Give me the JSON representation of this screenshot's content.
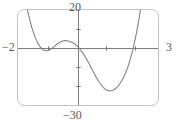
{
  "figure": {
    "kind": "graphing-calculator-screen",
    "frame_color": "#b9b9bb",
    "curve_color": "#7d7d80",
    "axis_color": "#6e6e70",
    "label_color": "#58585a",
    "background": "#ffffff"
  },
  "labels": {
    "y_max": "20",
    "y_min": "−30",
    "x_min": "−2",
    "x_max": "3"
  },
  "chart_data": {
    "type": "line",
    "title": "",
    "xlabel": "",
    "ylabel": "",
    "xlim": [
      -2,
      3
    ],
    "ylim": [
      -30,
      20
    ],
    "grid": false,
    "legend": "none",
    "tick_labels": {
      "x": [
        "−2",
        "3"
      ],
      "y": [
        "−30",
        "20"
      ]
    },
    "x_tick_values": [
      -1,
      1,
      2
    ],
    "y_tick_values": [
      -20,
      -10,
      10
    ],
    "annotations": [
      "viewing window [-2, 3] by [-30, 20]",
      "local minimum near x = -1.1, y ≈ -1",
      "local maximum near x = -0.1, y ≈ 3",
      "local minimum near x = 1.6, y ≈ -20",
      "x-intercepts near x = -1.1 and x = 2.1"
    ],
    "series": [
      {
        "name": "y",
        "x": [
          -2.0,
          -1.9,
          -1.8,
          -1.7,
          -1.6,
          -1.5,
          -1.4,
          -1.3,
          -1.2,
          -1.1,
          -1.0,
          -0.9,
          -0.8,
          -0.7,
          -0.6,
          -0.5,
          -0.4,
          -0.3,
          -0.2,
          -0.1,
          0.0,
          0.1,
          0.2,
          0.3,
          0.4,
          0.5,
          0.6,
          0.7,
          0.8,
          0.9,
          1.0,
          1.1,
          1.2,
          1.3,
          1.4,
          1.5,
          1.6,
          1.7,
          1.8,
          1.9,
          2.0,
          2.1,
          2.2,
          2.3,
          2.4,
          2.5,
          2.6,
          2.7,
          2.8,
          2.9,
          3.0
        ],
        "y": [
          48.0,
          38.4,
          29.9,
          22.4,
          16.0,
          10.5,
          6.1,
          2.7,
          0.4,
          -1.0,
          -1.5,
          -1.2,
          -0.3,
          0.9,
          2.1,
          3.1,
          3.7,
          3.9,
          3.7,
          3.2,
          2.4,
          1.2,
          -0.4,
          -2.3,
          -4.6,
          -7.2,
          -10.0,
          -12.8,
          -15.5,
          -18.0,
          -20.0,
          -21.5,
          -22.4,
          -22.6,
          -22.2,
          -21.2,
          -19.6,
          -17.4,
          -14.6,
          -11.0,
          -6.5,
          -1.0,
          5.6,
          13.4,
          22.6,
          33.2,
          45.4,
          59.3,
          75.0,
          92.6,
          112.0
        ]
      }
    ]
  }
}
